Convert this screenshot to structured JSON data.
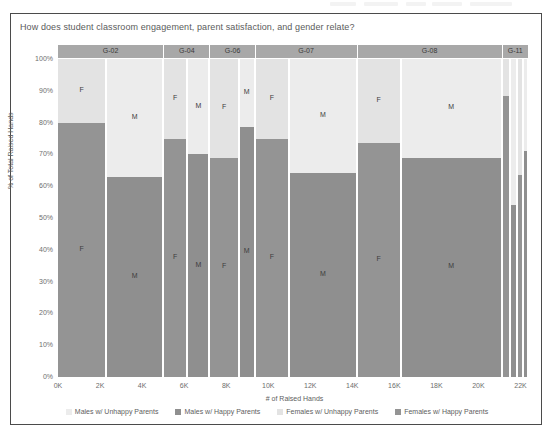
{
  "card": {
    "title": "How does student classroom engagement, parent satisfaction, and gender relate?"
  },
  "colors": {
    "males_unhappy": "#ececec",
    "males_happy": "#8f8f8f",
    "females_unhappy": "#e3e3e3",
    "females_happy": "#949494",
    "group_header": "#a8a8a8",
    "border": "#4b4b4b",
    "text": "#5e5e5e"
  },
  "legend": {
    "items": [
      {
        "label": "Males w/ Unhappy Parents",
        "color": "#ececec"
      },
      {
        "label": "Males w/ Happy Parents",
        "color": "#8f8f8f"
      },
      {
        "label": "Females w/ Unhappy Parents",
        "color": "#e3e3e3"
      },
      {
        "label": "Females w/ Happy Parents",
        "color": "#949494"
      }
    ]
  },
  "chart_data": {
    "type": "bar",
    "subtype": "marimekko",
    "title": "How does student classroom engagement, parent satisfaction, and gender relate?",
    "xlabel": "# of Raised Hands",
    "ylabel": "% of Total Raised Hands",
    "ylim": [
      0,
      100
    ],
    "xlim": [
      0,
      22500
    ],
    "yticks": [
      "0%",
      "10%",
      "20%",
      "30%",
      "40%",
      "50%",
      "60%",
      "70%",
      "80%",
      "90%",
      "100%"
    ],
    "ytick_values": [
      0,
      10,
      20,
      30,
      40,
      50,
      60,
      70,
      80,
      90,
      100
    ],
    "xticks": [
      "0K",
      "2K",
      "4K",
      "6K",
      "8K",
      "10K",
      "12K",
      "14K",
      "16K",
      "18K",
      "20K",
      "22K"
    ],
    "xtick_values": [
      0,
      2000,
      4000,
      6000,
      8000,
      10000,
      12000,
      14000,
      16000,
      18000,
      20000,
      22000
    ],
    "grid": false,
    "legend_position": "bottom",
    "groups": [
      {
        "name": "G-02",
        "x_start": 0,
        "x_end": 5050,
        "columns": [
          {
            "gender": "F",
            "label": "F",
            "x_start": 0,
            "x_end": 2350,
            "happy_pct": 80.0,
            "unhappy_pct": 20.0
          },
          {
            "gender": "M",
            "label": "M",
            "x_start": 2350,
            "x_end": 5050,
            "happy_pct": 63.0,
            "unhappy_pct": 37.0
          }
        ]
      },
      {
        "name": "G-04",
        "x_start": 5050,
        "x_end": 7250,
        "columns": [
          {
            "gender": "F",
            "label": "F",
            "x_start": 5050,
            "x_end": 6200,
            "happy_pct": 75.0,
            "unhappy_pct": 25.0
          },
          {
            "gender": "M",
            "label": "M",
            "x_start": 6200,
            "x_end": 7250,
            "happy_pct": 70.0,
            "unhappy_pct": 30.0
          }
        ]
      },
      {
        "name": "G-06",
        "x_start": 7250,
        "x_end": 9400,
        "columns": [
          {
            "gender": "F",
            "label": "F",
            "x_start": 7250,
            "x_end": 8650,
            "happy_pct": 69.0,
            "unhappy_pct": 31.0
          },
          {
            "gender": "M",
            "label": "M",
            "x_start": 8650,
            "x_end": 9400,
            "happy_pct": 78.5,
            "unhappy_pct": 21.5
          }
        ]
      },
      {
        "name": "G-07",
        "x_start": 9400,
        "x_end": 14250,
        "columns": [
          {
            "gender": "F",
            "label": "F",
            "x_start": 9400,
            "x_end": 11050,
            "happy_pct": 75.0,
            "unhappy_pct": 25.0
          },
          {
            "gender": "M",
            "label": "M",
            "x_start": 11050,
            "x_end": 14250,
            "happy_pct": 64.0,
            "unhappy_pct": 36.0
          }
        ]
      },
      {
        "name": "G-08",
        "x_start": 14250,
        "x_end": 21150,
        "columns": [
          {
            "gender": "F",
            "label": "F",
            "x_start": 14250,
            "x_end": 16350,
            "happy_pct": 73.5,
            "unhappy_pct": 26.5
          },
          {
            "gender": "M",
            "label": "M",
            "x_start": 16350,
            "x_end": 21150,
            "happy_pct": 69.0,
            "unhappy_pct": 31.0
          }
        ]
      },
      {
        "name": "G-11",
        "x_start": 21150,
        "x_end": 22400,
        "columns": [
          {
            "gender": "F",
            "label": "F",
            "x_start": 21150,
            "x_end": 21550,
            "happy_pct": 88.5,
            "unhappy_pct": 11.5
          },
          {
            "gender": "M",
            "label": "M",
            "x_start": 21550,
            "x_end": 21900,
            "happy_pct": 54.0,
            "unhappy_pct": 46.0
          },
          {
            "gender": "F",
            "label": "F",
            "x_start": 21900,
            "x_end": 22150,
            "happy_pct": 63.5,
            "unhappy_pct": 36.5
          },
          {
            "gender": "M",
            "label": "M",
            "x_start": 22150,
            "x_end": 22400,
            "happy_pct": 71.0,
            "unhappy_pct": 29.0
          }
        ]
      }
    ]
  }
}
